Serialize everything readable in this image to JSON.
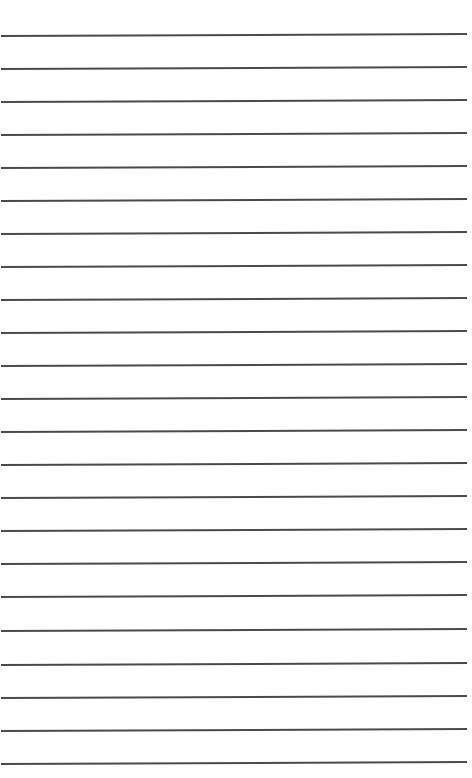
{
  "page": {
    "type": "lined-paper",
    "background": "#ffffff",
    "line_color": "#3b3b3b",
    "line_count": 23,
    "lines": [
      {
        "y": 35
      },
      {
        "y": 68
      },
      {
        "y": 101
      },
      {
        "y": 134
      },
      {
        "y": 167
      },
      {
        "y": 200
      },
      {
        "y": 233
      },
      {
        "y": 266
      },
      {
        "y": 299
      },
      {
        "y": 332
      },
      {
        "y": 365
      },
      {
        "y": 398
      },
      {
        "y": 431
      },
      {
        "y": 464
      },
      {
        "y": 497
      },
      {
        "y": 530
      },
      {
        "y": 563
      },
      {
        "y": 596
      },
      {
        "y": 630
      },
      {
        "y": 664
      },
      {
        "y": 697
      },
      {
        "y": 730
      },
      {
        "y": 763
      }
    ],
    "line_x_start": 1,
    "line_x_end": 467,
    "tilt_deg": -0.25
  }
}
